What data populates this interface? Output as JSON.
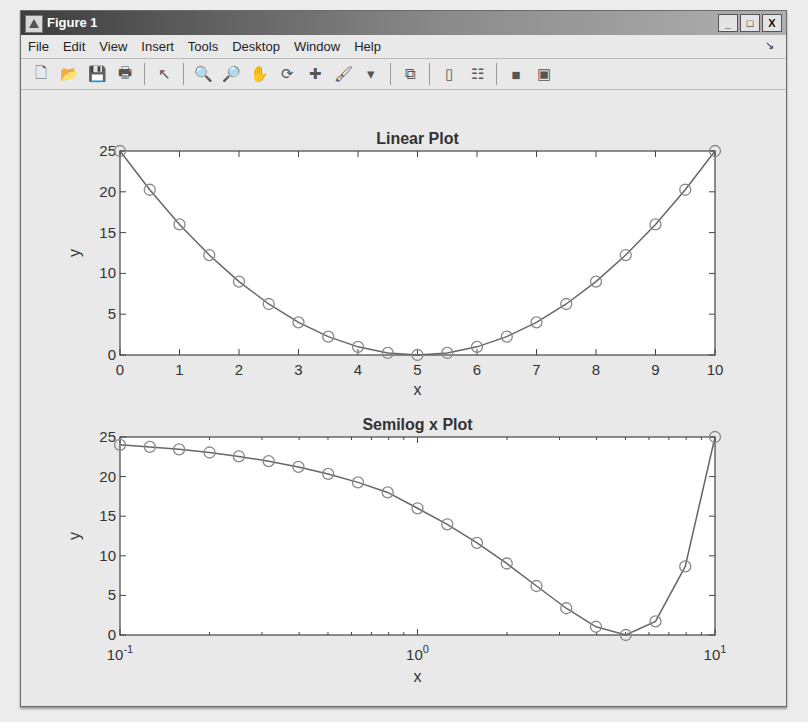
{
  "window": {
    "title": "Figure 1",
    "buttons": {
      "minimize": "_",
      "maximize": "□",
      "close": "X"
    }
  },
  "menu": [
    "File",
    "Edit",
    "View",
    "Insert",
    "Tools",
    "Desktop",
    "Window",
    "Help"
  ],
  "toolbar": [
    {
      "name": "new-figure-icon",
      "glyph": "🗋"
    },
    {
      "name": "open-file-icon",
      "glyph": "📂"
    },
    {
      "name": "save-icon",
      "glyph": "💾"
    },
    {
      "name": "print-icon",
      "glyph": "🖶"
    },
    {
      "sep": true
    },
    {
      "name": "pointer-icon",
      "glyph": "↖"
    },
    {
      "sep": true
    },
    {
      "name": "zoom-in-icon",
      "glyph": "🔍"
    },
    {
      "name": "zoom-out-icon",
      "glyph": "🔎"
    },
    {
      "name": "pan-hand-icon",
      "glyph": "✋"
    },
    {
      "name": "rotate-3d-icon",
      "glyph": "⟳"
    },
    {
      "name": "data-cursor-icon",
      "glyph": "✚"
    },
    {
      "name": "brush-icon",
      "glyph": "🖌"
    },
    {
      "name": "brush-dropdown-icon",
      "glyph": "▾"
    },
    {
      "sep": true
    },
    {
      "name": "link-plot-icon",
      "glyph": "⧉"
    },
    {
      "sep": true
    },
    {
      "name": "colorbar-icon",
      "glyph": "▯"
    },
    {
      "name": "legend-icon",
      "glyph": "☷"
    },
    {
      "sep": true
    },
    {
      "name": "hide-plot-tools-icon",
      "glyph": "■"
    },
    {
      "name": "show-plot-tools-icon",
      "glyph": "▣"
    }
  ],
  "chart_data": [
    {
      "type": "line",
      "title": "Linear Plot",
      "xlabel": "x",
      "ylabel": "y",
      "xscale": "linear",
      "xlim": [
        0,
        10
      ],
      "ylim": [
        0,
        25
      ],
      "xticks": [
        0,
        1,
        2,
        3,
        4,
        5,
        6,
        7,
        8,
        9,
        10
      ],
      "xtick_labels": [
        "0",
        "1",
        "2",
        "3",
        "4",
        "5",
        "6",
        "7",
        "8",
        "9",
        "10"
      ],
      "yticks": [
        0,
        5,
        10,
        15,
        20,
        25
      ],
      "ytick_labels": [
        "0",
        "5",
        "10",
        "15",
        "20",
        "25"
      ],
      "grid": false,
      "series": [
        {
          "name": "y=(x-5)^2",
          "marker": "circle",
          "color": "#666666",
          "x": [
            0,
            0.5,
            1,
            1.5,
            2,
            2.5,
            3,
            3.5,
            4,
            4.5,
            5,
            5.5,
            6,
            6.5,
            7,
            7.5,
            8,
            8.5,
            9,
            9.5,
            10
          ],
          "y": [
            25,
            20.25,
            16,
            12.25,
            9,
            6.25,
            4,
            2.25,
            1,
            0.25,
            0,
            0.25,
            1,
            2.25,
            4,
            6.25,
            9,
            12.25,
            16,
            20.25,
            25
          ]
        }
      ]
    },
    {
      "type": "line",
      "title": "Semilog x Plot",
      "xlabel": "x",
      "ylabel": "y",
      "xscale": "log",
      "xlim": [
        0.1,
        10
      ],
      "ylim": [
        0,
        25
      ],
      "xticks": [
        0.1,
        1,
        10
      ],
      "xtick_labels": [
        {
          "base": "10",
          "exp": "-1"
        },
        {
          "base": "10",
          "exp": "0"
        },
        {
          "base": "10",
          "exp": "1"
        }
      ],
      "yticks": [
        0,
        5,
        10,
        15,
        20,
        25
      ],
      "ytick_labels": [
        "0",
        "5",
        "10",
        "15",
        "20",
        "25"
      ],
      "grid": false,
      "series": [
        {
          "name": "y=(x-5)^2",
          "marker": "circle",
          "color": "#666666",
          "x": [
            0.1,
            0.126,
            0.158,
            0.2,
            0.251,
            0.316,
            0.398,
            0.501,
            0.631,
            0.794,
            1,
            1.259,
            1.585,
            1.995,
            2.512,
            3.162,
            3.981,
            5.012,
            6.31,
            7.943,
            10
          ],
          "y": [
            24.01,
            23.75,
            23.44,
            23.04,
            22.55,
            21.95,
            21.22,
            20.34,
            19.27,
            18.0,
            16.0,
            13.98,
            11.63,
            9.03,
            6.19,
            3.38,
            1.04,
            0.0,
            1.72,
            8.66,
            25.0
          ]
        }
      ]
    }
  ]
}
